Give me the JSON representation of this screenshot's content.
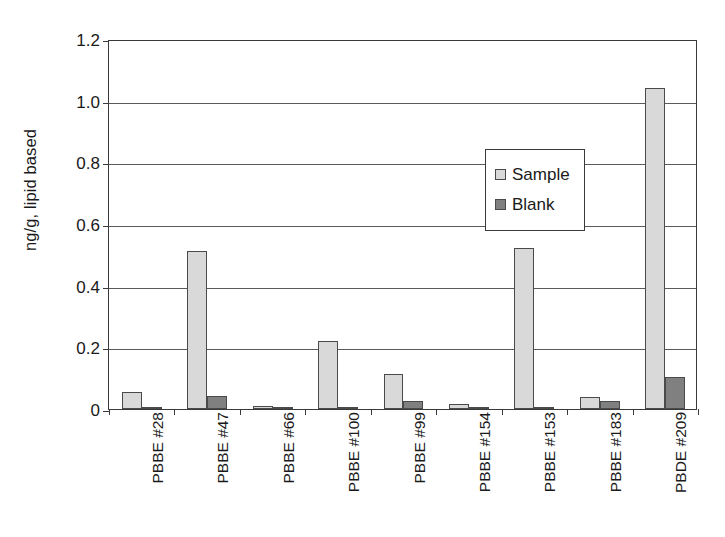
{
  "chart_data": {
    "type": "bar",
    "title": "",
    "xlabel": "",
    "ylabel": "ng/g, lipid based",
    "ylim": [
      0,
      1.2
    ],
    "ytick_labels": [
      "0",
      "0.2",
      "0.4",
      "0.6",
      "0.8",
      "1.0",
      "1.2"
    ],
    "ytick_values": [
      0,
      0.2,
      0.4,
      0.6,
      0.8,
      1.0,
      1.2
    ],
    "grid": "horizontal",
    "legend_position": "upper-center",
    "categories": [
      "PBBE #28",
      "PBBE #47",
      "PBBE #66",
      "PBBE #100",
      "PBBE #99",
      "PBBE #154",
      "PBBE #153",
      "PBBE #183",
      "PBDE #209"
    ],
    "series": [
      {
        "name": "Sample",
        "color": "#d9d9d9",
        "values": [
          0.055,
          0.512,
          0.01,
          0.222,
          0.115,
          0.015,
          0.521,
          0.038,
          1.04
        ]
      },
      {
        "name": "Blank",
        "color": "#808080",
        "values": [
          0.004,
          0.042,
          0.002,
          0.006,
          0.027,
          0.004,
          0.006,
          0.025,
          0.103
        ]
      }
    ]
  },
  "legend": {
    "entries": [
      {
        "label": "Sample",
        "swatch": "sample"
      },
      {
        "label": "Blank",
        "swatch": "blank"
      }
    ]
  }
}
